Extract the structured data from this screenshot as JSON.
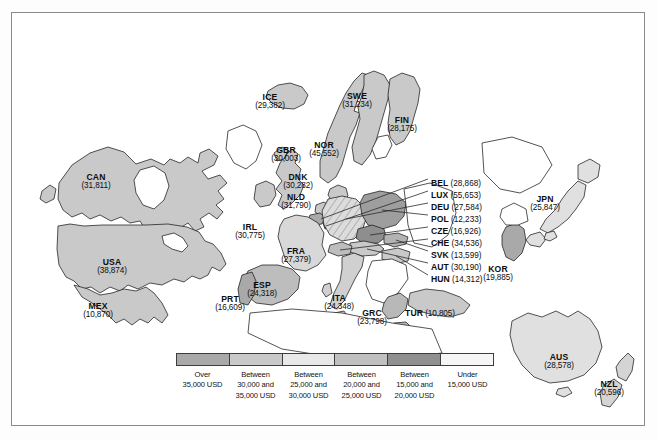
{
  "figure": {
    "background_color": "#ffffff",
    "border_color": "#8a8a8a"
  },
  "chart_data": {
    "type": "map",
    "unit": "USD",
    "value_format": "(n,nnn)",
    "legend_position": "bottom-center",
    "categories": [
      "Over 35,000 USD",
      "Between 30,000 and 35,000 USD",
      "Between 25,000 and 30,000 USD",
      "Between 20,000 and 25,000 USD",
      "Between 15,000 and 20,000 USD",
      "Under 15,000 USD"
    ],
    "bin_colors": [
      "#a9a9a9",
      "#c6c6c6",
      "#e3e3e3",
      "#bdbdbd",
      "#8e8e8e",
      "#f4f4f4"
    ],
    "countries": [
      {
        "code": "CAN",
        "value": 31811,
        "bin": 1
      },
      {
        "code": "USA",
        "value": 38874,
        "bin": 0
      },
      {
        "code": "MEX",
        "value": 10870,
        "bin": 5
      },
      {
        "code": "ICE",
        "value": 29382,
        "bin": 2
      },
      {
        "code": "GBR",
        "value": 30003,
        "bin": 1
      },
      {
        "code": "DNK",
        "value": 30282,
        "bin": 1
      },
      {
        "code": "NLD",
        "value": 31790,
        "bin": 1
      },
      {
        "code": "IRL",
        "value": 30775,
        "bin": 1
      },
      {
        "code": "NOR",
        "value": 45552,
        "bin": 0
      },
      {
        "code": "SWE",
        "value": 31234,
        "bin": 1
      },
      {
        "code": "FIN",
        "value": 28175,
        "bin": 2
      },
      {
        "code": "FRA",
        "value": 27379,
        "bin": 2
      },
      {
        "code": "PRT",
        "value": 16609,
        "bin": 4
      },
      {
        "code": "ESP",
        "value": 24318,
        "bin": 3
      },
      {
        "code": "ITA",
        "value": 24348,
        "bin": 3
      },
      {
        "code": "GRC",
        "value": 23798,
        "bin": 3
      },
      {
        "code": "TUR",
        "value": 10805,
        "bin": 5
      },
      {
        "code": "BEL",
        "value": 28868,
        "bin": 2
      },
      {
        "code": "LUX",
        "value": 55653,
        "bin": 0
      },
      {
        "code": "DEU",
        "value": 27584,
        "bin": 2
      },
      {
        "code": "POL",
        "value": 12233,
        "bin": 5
      },
      {
        "code": "CZE",
        "value": 16926,
        "bin": 4
      },
      {
        "code": "CHE",
        "value": 34536,
        "bin": 1
      },
      {
        "code": "SVK",
        "value": 13599,
        "bin": 5
      },
      {
        "code": "AUT",
        "value": 30190,
        "bin": 1
      },
      {
        "code": "HUN",
        "value": 14312,
        "bin": 5
      },
      {
        "code": "JPN",
        "value": 25847,
        "bin": 3
      },
      {
        "code": "KOR",
        "value": 19885,
        "bin": 4
      },
      {
        "code": "AUS",
        "value": 28578,
        "bin": 2
      },
      {
        "code": "NZL",
        "value": 20596,
        "bin": 3
      }
    ]
  },
  "map_labels": [
    {
      "name": "CAN",
      "code": "CAN",
      "value": "(31,811)",
      "x": 84,
      "y": 160,
      "w": 54,
      "layout": "stack"
    },
    {
      "name": "USA",
      "code": "USA",
      "value": "(38,874)",
      "x": 100,
      "y": 245,
      "w": 54,
      "layout": "stack"
    },
    {
      "name": "MEX",
      "code": "MEX",
      "value": "(10,870)",
      "x": 86,
      "y": 289,
      "w": 50,
      "layout": "stack"
    },
    {
      "name": "ICE",
      "code": "ICE",
      "value": "(29,382)",
      "x": 258,
      "y": 80,
      "w": 46,
      "layout": "stack"
    },
    {
      "name": "GBR",
      "code": "GBR",
      "value": "(30,003)",
      "x": 274,
      "y": 133,
      "w": 48,
      "layout": "stack"
    },
    {
      "name": "DNK",
      "code": "DNK",
      "value": "(30,282)",
      "x": 286,
      "y": 160,
      "w": 48,
      "layout": "stack"
    },
    {
      "name": "NLD",
      "code": "NLD",
      "value": "(31,790)",
      "x": 284,
      "y": 180,
      "w": 48,
      "layout": "stack"
    },
    {
      "name": "IRL",
      "code": "IRL",
      "value": "(30,775)",
      "x": 238,
      "y": 210,
      "w": 46,
      "layout": "stack"
    },
    {
      "name": "NOR",
      "code": "NOR",
      "value": "(45,552)",
      "x": 312,
      "y": 128,
      "w": 46,
      "layout": "stack"
    },
    {
      "name": "SWE",
      "code": "SWE",
      "value": "(31,234)",
      "x": 345,
      "y": 79,
      "w": 48,
      "layout": "stack"
    },
    {
      "name": "FIN",
      "code": "FIN",
      "value": "(28,175)",
      "x": 390,
      "y": 103,
      "w": 46,
      "layout": "stack"
    },
    {
      "name": "FRA",
      "code": "FRA",
      "value": "(27,379)",
      "x": 284,
      "y": 234,
      "w": 48,
      "layout": "stack"
    },
    {
      "name": "PRT",
      "code": "PRT",
      "value": "(16,609)",
      "x": 218,
      "y": 282,
      "w": 46,
      "layout": "stack"
    },
    {
      "name": "ESP",
      "code": "ESP",
      "value": "(24,318)",
      "x": 250,
      "y": 268,
      "w": 46,
      "layout": "stack"
    },
    {
      "name": "ITA",
      "code": "ITA",
      "value": "(24,348)",
      "x": 327,
      "y": 281,
      "w": 44,
      "layout": "stack"
    },
    {
      "name": "GRC",
      "code": "GRC",
      "value": "(23,798)",
      "x": 360,
      "y": 296,
      "w": 48,
      "layout": "stack"
    },
    {
      "name": "TUR",
      "code": "TUR",
      "value": "(10,805)",
      "x": 418,
      "y": 290,
      "w": 66,
      "layout": "inline"
    },
    {
      "name": "JPN",
      "code": "JPN",
      "value": "(25,847)",
      "x": 533,
      "y": 182,
      "w": 46,
      "layout": "stack"
    },
    {
      "name": "KOR",
      "code": "KOR",
      "value": "(19,885)",
      "x": 486,
      "y": 252,
      "w": 46,
      "layout": "stack"
    },
    {
      "name": "AUS",
      "code": "AUS",
      "value": "(28,578)",
      "x": 547,
      "y": 340,
      "w": 46,
      "layout": "stack"
    },
    {
      "name": "NZL",
      "code": "NZL",
      "value": "(20,596)",
      "x": 597,
      "y": 367,
      "w": 46,
      "layout": "stack"
    }
  ],
  "callouts": [
    {
      "name": "BEL",
      "code": "BEL",
      "value": "(28,868)",
      "x": 419,
      "y": 166
    },
    {
      "name": "LUX",
      "code": "LUX",
      "value": "(55,653)",
      "x": 419,
      "y": 178
    },
    {
      "name": "DEU",
      "code": "DEU",
      "value": "(27,584)",
      "x": 419,
      "y": 190
    },
    {
      "name": "POL",
      "code": "POL",
      "value": "(12,233)",
      "x": 419,
      "y": 202
    },
    {
      "name": "CZE",
      "code": "CZE",
      "value": "(16,926)",
      "x": 419,
      "y": 214
    },
    {
      "name": "CHE",
      "code": "CHE",
      "value": "(34,536)",
      "x": 419,
      "y": 226
    },
    {
      "name": "SVK",
      "code": "SVK",
      "value": "(13,599)",
      "x": 419,
      "y": 238
    },
    {
      "name": "AUT",
      "code": "AUT",
      "value": "(30,190)",
      "x": 419,
      "y": 250
    },
    {
      "name": "HUN",
      "code": "HUN",
      "value": "(14,312)",
      "x": 419,
      "y": 262
    }
  ],
  "legend": {
    "name": "map-legend",
    "swatches": [
      "#a9a9a9",
      "#c9c9c9",
      "#e8e8e8",
      "#c0c0c0",
      "#909090",
      "#f6f6f6"
    ],
    "items": [
      {
        "l1": "Over",
        "l2": "35,000 USD",
        "l3": ""
      },
      {
        "l1": "Between",
        "l2": "30,000 and",
        "l3": "35,000 USD"
      },
      {
        "l1": "Between",
        "l2": "25,000 and",
        "l3": "30,000 USD"
      },
      {
        "l1": "Between",
        "l2": "20,000 and",
        "l3": "25,000 USD"
      },
      {
        "l1": "Between",
        "l2": "15,000 and",
        "l3": "20,000 USD"
      },
      {
        "l1": "Under",
        "l2": "15,000 USD",
        "l3": ""
      }
    ]
  }
}
